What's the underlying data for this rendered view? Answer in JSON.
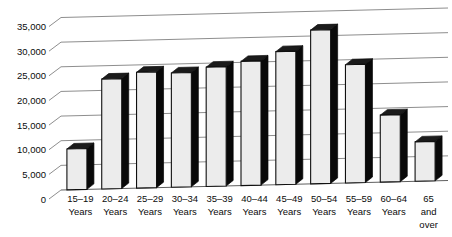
{
  "chart_data": {
    "type": "bar",
    "title": "",
    "subtitle": "",
    "xlabel": "",
    "ylabel": "",
    "grid": true,
    "legend": "none",
    "style": "3d-perspective-column",
    "ylim": [
      0,
      35000
    ],
    "ytick_interval": 5000,
    "ytick_labels": [
      "0",
      "5,000",
      "10,000",
      "15,000",
      "20,000",
      "25,000",
      "30,000",
      "35,000"
    ],
    "ytick_values": [
      0,
      5000,
      10000,
      15000,
      20000,
      25000,
      30000,
      35000
    ],
    "categories": [
      "15–19 Years",
      "20–24 Years",
      "25–29 Years",
      "30–34 Years",
      "35–39 Years",
      "40–44 Years",
      "45–49 Years",
      "50–54 Years",
      "55–59 Years",
      "60–64 Years",
      "65 and over"
    ],
    "category_lines": [
      [
        "15–19",
        "Years"
      ],
      [
        "20–24",
        "Years"
      ],
      [
        "25–29",
        "Years"
      ],
      [
        "30–34",
        "Years"
      ],
      [
        "35–39",
        "Years"
      ],
      [
        "40–44",
        "Years"
      ],
      [
        "45–49",
        "Years"
      ],
      [
        "50–54",
        "Years"
      ],
      [
        "55–59",
        "Years"
      ],
      [
        "60–64",
        "Years"
      ],
      [
        "65",
        "and",
        "over"
      ]
    ],
    "values": [
      8300,
      22300,
      23500,
      23200,
      24200,
      25200,
      27000,
      31200,
      24000,
      13600,
      8000
    ],
    "colors": {
      "bar_face": "#ececec",
      "bar_side": "#090909",
      "bar_outline": "#101010",
      "gridline": "#8e8e8e",
      "text": "#0b0b0b",
      "background": "#ffffff"
    }
  }
}
